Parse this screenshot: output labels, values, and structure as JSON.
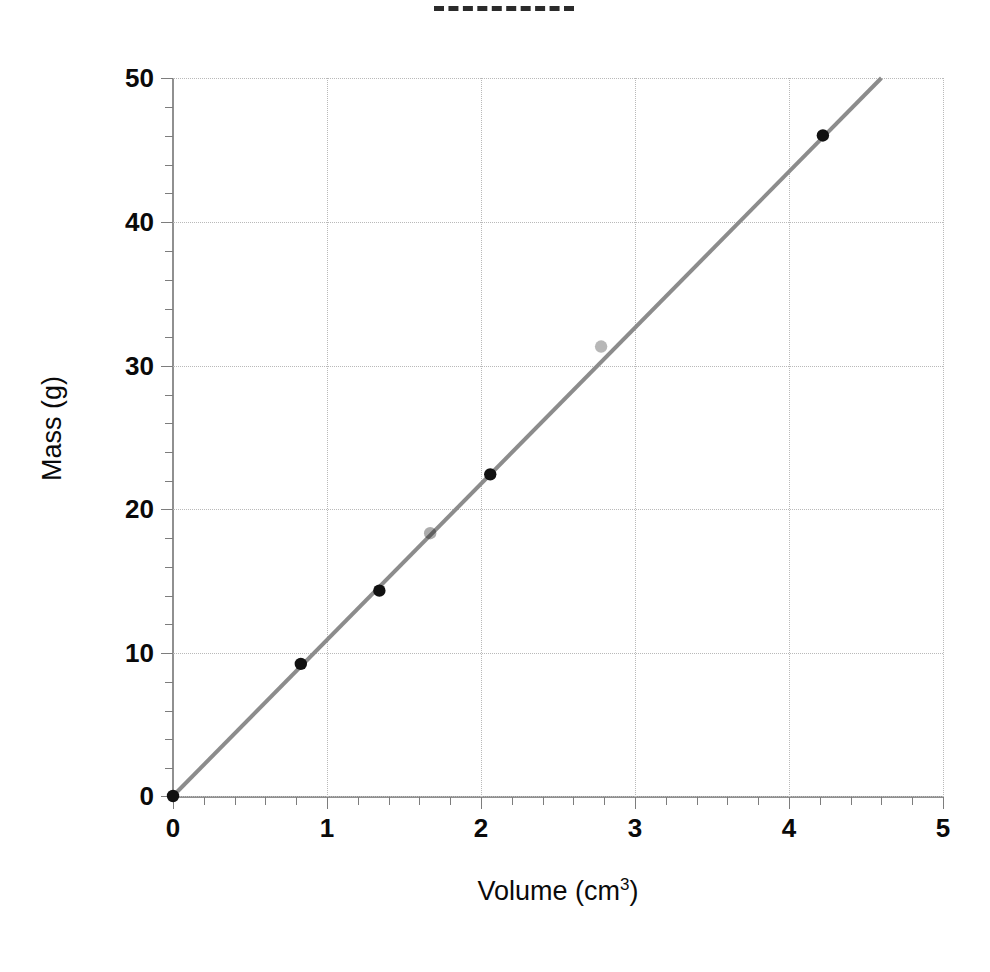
{
  "chart_data": {
    "type": "scatter",
    "title": "",
    "xlabel": "Volume (cm3)",
    "xlabel_base": "Volume (cm",
    "xlabel_sup": "3",
    "xlabel_tail": ")",
    "ylabel": "Mass (g)",
    "xlim": [
      0,
      5
    ],
    "ylim": [
      0,
      50
    ],
    "grid": true,
    "legend": "none",
    "x_major_ticks": [
      0,
      1,
      2,
      3,
      4,
      5
    ],
    "x_tick_labels": [
      "0",
      "1",
      "2",
      "3",
      "4",
      "5"
    ],
    "x_minor_step": 0.2,
    "y_major_ticks": [
      0,
      10,
      20,
      30,
      40,
      50
    ],
    "y_tick_labels": [
      "0",
      "10",
      "20",
      "30",
      "40",
      "50"
    ],
    "y_minor_step": 2,
    "series": [
      {
        "name": "measured-points",
        "marker": "filled-circle",
        "marker_color": "#111111",
        "x": [
          0.0,
          0.83,
          1.34,
          1.67,
          2.06,
          2.78,
          4.22
        ],
        "y": [
          0.0,
          9.2,
          14.3,
          18.3,
          22.4,
          31.3,
          46.0
        ],
        "marker_opacity": [
          1,
          1,
          1,
          0.35,
          1,
          0.3,
          1
        ]
      },
      {
        "name": "best-fit-line",
        "marker": "none",
        "line_color": "#8c8c8c",
        "line_width": 4,
        "x": [
          0.0,
          4.6
        ],
        "y": [
          0.0,
          50.0
        ],
        "slope": 10.87,
        "intercept": 0.0
      }
    ],
    "artifacts": [
      {
        "name": "top-dashed-segment",
        "description": "stray dashed line fragment at top of page"
      }
    ],
    "colors": {
      "grid": "#b9b9b9",
      "axis": "#909090",
      "line": "#8c8c8c",
      "marker": "#111111",
      "text": "#0a0a0a",
      "background": "#ffffff"
    }
  }
}
